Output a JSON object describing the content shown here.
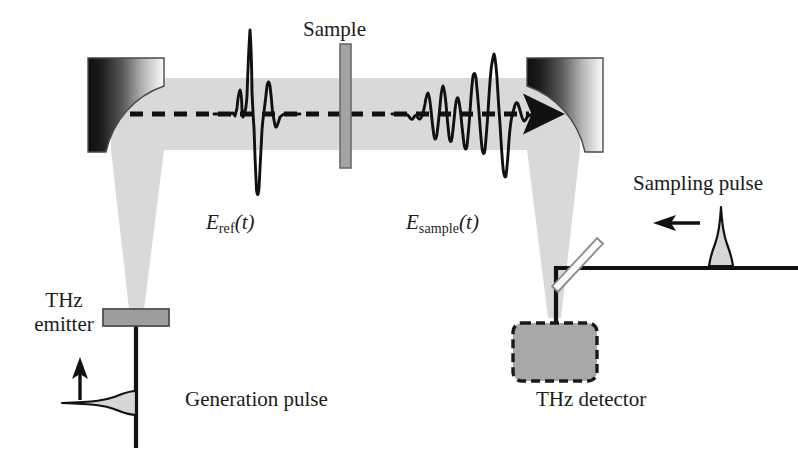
{
  "figure": {
    "kind": "optics-schematic",
    "title_visible": false,
    "background_color": "#ffffff",
    "width": 798,
    "height": 461
  },
  "palette": {
    "ink": "#111111",
    "label_ink": "#1b1b1b",
    "thz_beam_fill": "#d9d9d9",
    "mirror_dark": "#1a1a1a",
    "mirror_light": "#f2f2f2",
    "mirror_outline": "#4a4a4a",
    "sample_fill": "#a3a3a3",
    "sample_outline": "#6b6b6b",
    "emitter_fill": "#9e9e9e",
    "emitter_outline": "#4f4f4f",
    "detector_fill": "#a8a8a8",
    "detector_outline": "#1a1a1a",
    "splitter_fill": "#fbfbfb",
    "splitter_outline": "#8a8a8a",
    "pulse_fill": "#d6d6d6"
  },
  "labels": {
    "sample": "Sample",
    "thz_emitter_line1": "THz",
    "thz_emitter_line2": "emitter",
    "generation_pulse": "Generation pulse",
    "sampling_pulse": "Sampling pulse",
    "thz_detector": "THz detector",
    "e_ref": {
      "symbol": "E",
      "subscript": "ref",
      "argument": "(t)"
    },
    "e_sample": {
      "symbol": "E",
      "subscript": "sample",
      "argument": "(t)"
    }
  },
  "components": [
    {
      "name": "thz-emitter",
      "type": "source",
      "label": "THz emitter"
    },
    {
      "name": "parabolic-mirror-left",
      "type": "off-axis-parabolic-mirror"
    },
    {
      "name": "sample-slab",
      "type": "sample",
      "label": "Sample"
    },
    {
      "name": "parabolic-mirror-right",
      "type": "off-axis-parabolic-mirror"
    },
    {
      "name": "beam-splitter",
      "type": "pellicle-beamsplitter"
    },
    {
      "name": "thz-detector",
      "type": "detector",
      "label": "THz detector"
    }
  ],
  "beams": {
    "thz_path_dashed": true,
    "thz_propagation_direction": "left-to-right",
    "generation_pulse_direction": "upward",
    "sampling_pulse_direction": "leftward"
  },
  "waveforms": {
    "reference": {
      "name": "E_ref(t)",
      "description": "single-cycle THz transient: small precursor, tall positive spike, deep negative dip, secondary positive lobe, weak ringing",
      "samples": [
        [
          0.0,
          0.0
        ],
        [
          0.09,
          0.0
        ],
        [
          0.16,
          0.01
        ],
        [
          0.2,
          -0.02
        ],
        [
          0.236,
          0.06
        ],
        [
          0.262,
          0.3
        ],
        [
          0.276,
          0.33
        ],
        [
          0.292,
          0.12
        ],
        [
          0.306,
          -0.04
        ],
        [
          0.322,
          0.1
        ],
        [
          0.338,
          0.62
        ],
        [
          0.352,
          1.0
        ],
        [
          0.362,
          0.88
        ],
        [
          0.372,
          0.3
        ],
        [
          0.386,
          -0.42
        ],
        [
          0.398,
          -0.92
        ],
        [
          0.408,
          -1.0
        ],
        [
          0.42,
          -0.72
        ],
        [
          0.432,
          -0.18
        ],
        [
          0.446,
          0.24
        ],
        [
          0.46,
          0.42
        ],
        [
          0.472,
          0.4
        ],
        [
          0.486,
          0.18
        ],
        [
          0.5,
          -0.1
        ],
        [
          0.514,
          -0.2
        ],
        [
          0.53,
          -0.14
        ],
        [
          0.548,
          -0.04
        ],
        [
          0.57,
          0.02
        ],
        [
          0.6,
          0.01
        ],
        [
          0.7,
          0.0
        ],
        [
          1.0,
          0.0
        ]
      ]
    },
    "sample": {
      "name": "E_sample(t)",
      "description": "dispersed / chirped THz transient after the sample: long oscillatory train building to a large peak followed by a deep dip and ringdown",
      "samples": [
        [
          0.0,
          0.0
        ],
        [
          0.06,
          0.0
        ],
        [
          0.1,
          -0.04
        ],
        [
          0.124,
          0.06
        ],
        [
          0.146,
          -0.06
        ],
        [
          0.168,
          0.04
        ],
        [
          0.19,
          -0.1
        ],
        [
          0.212,
          0.3
        ],
        [
          0.228,
          0.34
        ],
        [
          0.244,
          0.1
        ],
        [
          0.258,
          -0.3
        ],
        [
          0.272,
          -0.56
        ],
        [
          0.286,
          -0.3
        ],
        [
          0.3,
          0.2
        ],
        [
          0.314,
          0.62
        ],
        [
          0.326,
          0.66
        ],
        [
          0.34,
          0.3
        ],
        [
          0.352,
          -0.28
        ],
        [
          0.364,
          -0.66
        ],
        [
          0.376,
          -0.58
        ],
        [
          0.388,
          -0.16
        ],
        [
          0.4,
          0.28
        ],
        [
          0.412,
          0.4
        ],
        [
          0.424,
          0.22
        ],
        [
          0.436,
          -0.22
        ],
        [
          0.448,
          -0.6
        ],
        [
          0.46,
          -0.74
        ],
        [
          0.472,
          -0.44
        ],
        [
          0.484,
          0.14
        ],
        [
          0.496,
          0.7
        ],
        [
          0.508,
          0.9
        ],
        [
          0.518,
          0.74
        ],
        [
          0.53,
          0.26
        ],
        [
          0.542,
          -0.3
        ],
        [
          0.554,
          -0.66
        ],
        [
          0.566,
          -0.62
        ],
        [
          0.578,
          -0.26
        ],
        [
          0.59,
          0.24
        ],
        [
          0.602,
          0.7
        ],
        [
          0.612,
          0.98
        ],
        [
          0.622,
          1.0
        ],
        [
          0.632,
          0.72
        ],
        [
          0.644,
          0.16
        ],
        [
          0.656,
          -0.44
        ],
        [
          0.668,
          -0.86
        ],
        [
          0.678,
          -1.0
        ],
        [
          0.69,
          -0.82
        ],
        [
          0.702,
          -0.4
        ],
        [
          0.714,
          -0.02
        ],
        [
          0.726,
          0.22
        ],
        [
          0.738,
          0.28
        ],
        [
          0.75,
          0.2
        ],
        [
          0.764,
          0.04
        ],
        [
          0.778,
          -0.08
        ],
        [
          0.792,
          -0.1
        ],
        [
          0.808,
          -0.05
        ],
        [
          0.828,
          -0.01
        ],
        [
          0.86,
          0.0
        ],
        [
          1.0,
          0.0
        ]
      ]
    },
    "generation_pulse": {
      "name": "Generation pulse",
      "description": "short near-infrared optical pulse travelling upward toward the THz emitter",
      "shape": "gaussian",
      "orientation": "horizontal-lobe-on-vertical-axis"
    },
    "sampling_pulse": {
      "name": "Sampling pulse",
      "description": "short near-infrared gating pulse travelling leftward toward the detector",
      "shape": "gaussian",
      "orientation": "vertical-lobe-on-horizontal-axis"
    }
  }
}
